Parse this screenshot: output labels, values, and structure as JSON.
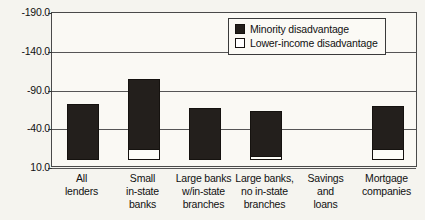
{
  "chart_data": {
    "type": "bar",
    "title": "",
    "subtitle": "",
    "xlabel": "",
    "ylabel": "",
    "ylim": [
      10.0,
      -190.0
    ],
    "y_axis_inverted": true,
    "grid": true,
    "legend_position": "top-right",
    "yticks": [
      {
        "value": -190.0,
        "label": "-190.0"
      },
      {
        "value": -140.0,
        "label": "-140.0"
      },
      {
        "value": -90.0,
        "label": "-90.0"
      },
      {
        "value": -40.0,
        "label": "-40.0"
      },
      {
        "value": 10.0,
        "label": "10.0"
      }
    ],
    "categories": [
      "All lenders",
      "Small in-state banks",
      "Large banks w/in-state branches",
      "Large banks, no in-state branches",
      "Savings and loans",
      "Mortgage companies"
    ],
    "category_lines": [
      [
        "All",
        "lenders"
      ],
      [
        "Small",
        "in-state",
        "banks"
      ],
      [
        "Large banks",
        "w/in-state",
        "branches"
      ],
      [
        "Large banks,",
        "no in-state",
        "branches"
      ],
      [
        "Savings",
        "and",
        "loans"
      ],
      [
        "Mortgage",
        "companies"
      ]
    ],
    "series": [
      {
        "name": "Minority disadvantage",
        "color": "#231f1c",
        "values": [
          -72,
          -105,
          -68,
          -63,
          0,
          -70
        ]
      },
      {
        "name": "Lower-income disadvantage",
        "color": "#ffffff",
        "values": [
          0,
          -15,
          0,
          -5,
          0,
          -15
        ]
      }
    ]
  },
  "legend": {
    "items": [
      {
        "label": "Minority disadvantage",
        "swatch": "filled-square-icon"
      },
      {
        "label": "Lower-income disadvantage",
        "swatch": "hollow-square-icon"
      }
    ]
  }
}
